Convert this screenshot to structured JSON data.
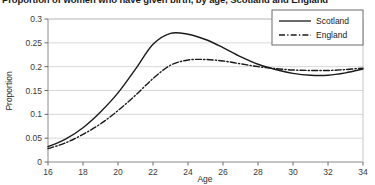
{
  "figure": {
    "title": "Proportion of women who have given birth, by age, Scotland and England",
    "background_color": "#ffffff",
    "frame_color": "#8a8a8a",
    "gridline_color": "#d8d8d8",
    "line_color": "#1a1a1a"
  },
  "legend": {
    "position": "top-right",
    "entries": [
      {
        "label": "Scotland",
        "style": "solid"
      },
      {
        "label": "England",
        "style": "dash-dot"
      }
    ]
  },
  "chart_data": {
    "type": "line",
    "title": "Proportion of women who have given birth, by age, Scotland and England",
    "xlabel": "Age",
    "ylabel": "Proportion",
    "xlim": [
      16,
      34
    ],
    "ylim": [
      0,
      0.3
    ],
    "xticks": [
      16,
      18,
      20,
      22,
      24,
      26,
      28,
      30,
      32,
      34
    ],
    "xtick_labels": [
      "16",
      "18",
      "20",
      "22",
      "24",
      "26",
      "28",
      "30",
      "32",
      "34"
    ],
    "yticks": [
      0,
      0.05,
      0.1,
      0.15,
      0.2,
      0.25,
      0.3
    ],
    "ytick_labels": [
      "0",
      "0.05",
      "0.1",
      "0.15",
      "0.2",
      "0.25",
      "0.3"
    ],
    "grid": true,
    "grid_axis": "y",
    "legend_position": "upper right",
    "x": [
      16,
      17,
      18,
      19,
      20,
      21,
      22,
      23,
      24,
      25,
      26,
      27,
      28,
      29,
      30,
      31,
      32,
      33,
      34
    ],
    "series": [
      {
        "name": "Scotland",
        "style": "solid",
        "color": "#1a1a1a",
        "values": [
          0.032,
          0.048,
          0.072,
          0.105,
          0.145,
          0.195,
          0.247,
          0.27,
          0.268,
          0.257,
          0.24,
          0.221,
          0.205,
          0.194,
          0.186,
          0.182,
          0.182,
          0.187,
          0.195
        ]
      },
      {
        "name": "England",
        "style": "dash-dot",
        "color": "#1a1a1a",
        "values": [
          0.028,
          0.04,
          0.058,
          0.08,
          0.108,
          0.14,
          0.175,
          0.203,
          0.214,
          0.215,
          0.212,
          0.206,
          0.2,
          0.196,
          0.193,
          0.192,
          0.192,
          0.194,
          0.197
        ]
      }
    ]
  }
}
